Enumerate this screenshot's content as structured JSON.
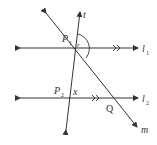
{
  "diagram": {
    "lines": {
      "t": "t",
      "l1": "l",
      "l1_sub": "1",
      "l2": "l",
      "l2_sub": "2",
      "m": "m"
    },
    "points": {
      "P1": "P",
      "P1_sub": "1",
      "P2": "P",
      "P2_sub": "2",
      "Q": "Q"
    },
    "angles": {
      "upper": "r",
      "lower": "x"
    },
    "colors": {
      "stroke": "#333333",
      "background": "#ffffff"
    }
  }
}
